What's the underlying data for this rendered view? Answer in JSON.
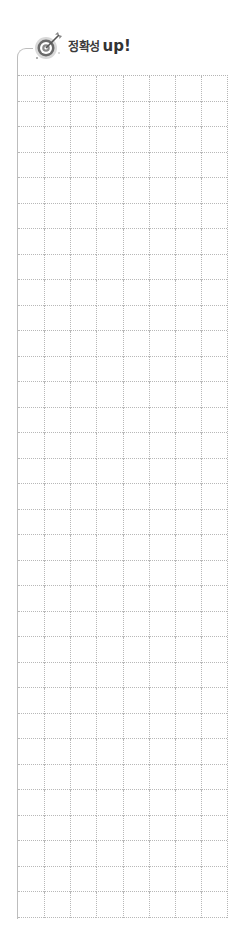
{
  "header": {
    "icon": "target-arrow-icon",
    "title_korean": "정확성",
    "title_english": "up!"
  },
  "grid": {
    "columns": 8,
    "rows": 33,
    "line_style": "dotted",
    "line_color": "#b8b8b8",
    "border_color": "#bdbdbd"
  },
  "colors": {
    "title_text": "#3a3a3a",
    "icon_ring_dark": "#6b6b6b",
    "icon_ring_light": "#bdbdbd",
    "background": "#ffffff"
  }
}
